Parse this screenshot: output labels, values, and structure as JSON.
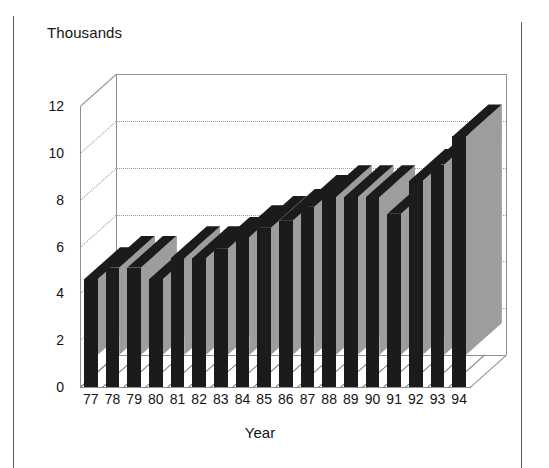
{
  "chart_data": {
    "type": "bar",
    "title": "",
    "subtitle": "",
    "xlabel": "Year",
    "ylabel": "Thousands",
    "categories": [
      "77",
      "78",
      "79",
      "80",
      "81",
      "82",
      "83",
      "84",
      "85",
      "86",
      "87",
      "88",
      "89",
      "90",
      "91",
      "92",
      "93",
      "94"
    ],
    "values": [
      4.6,
      5.1,
      5.1,
      4.6,
      5.5,
      5.5,
      5.9,
      6.4,
      6.8,
      7.1,
      7.7,
      8.1,
      8.1,
      8.1,
      7.4,
      8.8,
      9.5,
      10.7
    ],
    "ylim": [
      0,
      12
    ],
    "yticks": [
      "0",
      "2",
      "4",
      "6",
      "8",
      "10",
      "12"
    ],
    "ytick_values": [
      0,
      2,
      4,
      6,
      8,
      10,
      12
    ],
    "grid": true,
    "gridline_style": "dotted",
    "legend": null,
    "legend_position": "none",
    "projection": "3d-column",
    "series": [
      {
        "name": "",
        "values": [
          4.6,
          5.1,
          5.1,
          4.6,
          5.5,
          5.5,
          5.9,
          6.4,
          6.8,
          7.1,
          7.7,
          8.1,
          8.1,
          8.1,
          7.4,
          8.8,
          9.5,
          10.7
        ]
      }
    ],
    "colors": {
      "bar_front": "#1b1b1b",
      "bar_side": "#9d9d9d",
      "bar_top": "#1b1b1b",
      "axis": "#8f8f8f",
      "grid": "#9a9a9a",
      "text": "#141414",
      "background": "#ffffff",
      "page_rule": "#5a5a5a"
    }
  }
}
